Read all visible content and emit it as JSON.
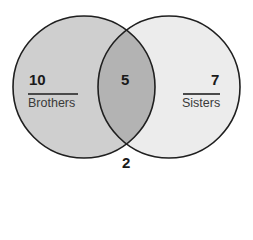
{
  "diagram": {
    "type": "venn",
    "sets": [
      {
        "name": "Brothers",
        "only_count": "10",
        "fill": "#cfcfcf"
      },
      {
        "name": "Sisters",
        "only_count": "7",
        "fill": "#ececec"
      }
    ],
    "intersection": {
      "count": "5",
      "fill": "#b3b3b3"
    },
    "outside": {
      "count": "2"
    },
    "stroke": "#1f1f1f"
  }
}
